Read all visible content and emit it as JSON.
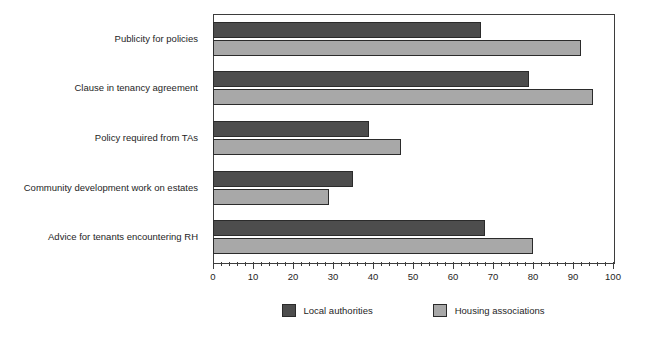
{
  "chart_data": {
    "type": "bar",
    "orientation": "horizontal",
    "title": "",
    "xlabel": "",
    "ylabel": "",
    "xlim": [
      0,
      100
    ],
    "grid": false,
    "legend_position": "bottom-center",
    "x_ticks_major": [
      0,
      10,
      20,
      30,
      40,
      50,
      60,
      70,
      80,
      90,
      100
    ],
    "x_tick_labels": [
      "0",
      "10",
      "20",
      "30",
      "40",
      "50",
      "60",
      "70",
      "80",
      "90",
      "100"
    ],
    "x_tick_minor_step": 2,
    "categories": [
      "Publicity for policies",
      "Clause in tenancy agreement",
      "Policy required from TAs",
      "Community development work on estates",
      "Advice for tenants encountering RH"
    ],
    "series": [
      {
        "name": "Local authorities",
        "color": "#4d4d4d",
        "values": [
          67,
          79,
          39,
          35,
          68
        ]
      },
      {
        "name": "Housing associations",
        "color": "#a8a8a8",
        "values": [
          92,
          95,
          47,
          29,
          80
        ]
      }
    ]
  },
  "legend": {
    "entries": [
      {
        "label": "Local authorities"
      },
      {
        "label": "Housing associations"
      }
    ]
  }
}
